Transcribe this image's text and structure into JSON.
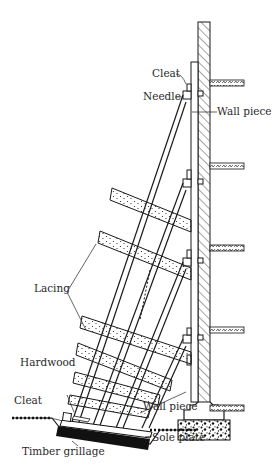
{
  "diagram": {
    "labels": {
      "cleat_top": "Cleat",
      "needle": "Needle",
      "wall_piece_top": "Wall piece",
      "lacing": "Lacing",
      "hardwood_line1": "Hardwood",
      "hardwood_line2": "folding wedges",
      "cleat_bottom": "Cleat",
      "wall_piece_bottom": "Wall piece",
      "sole_plate": "Sole plate",
      "timber_grillage": "Timber grillage"
    },
    "icons": {
      "hatch": "diagonal-hatch-pattern",
      "concrete": "speckled-concrete-pattern",
      "ground": "earth-hatch-pattern"
    },
    "colors": {
      "ink": "#1a1a1a",
      "background": "#ffffff",
      "label": "#2a2a2a"
    }
  }
}
